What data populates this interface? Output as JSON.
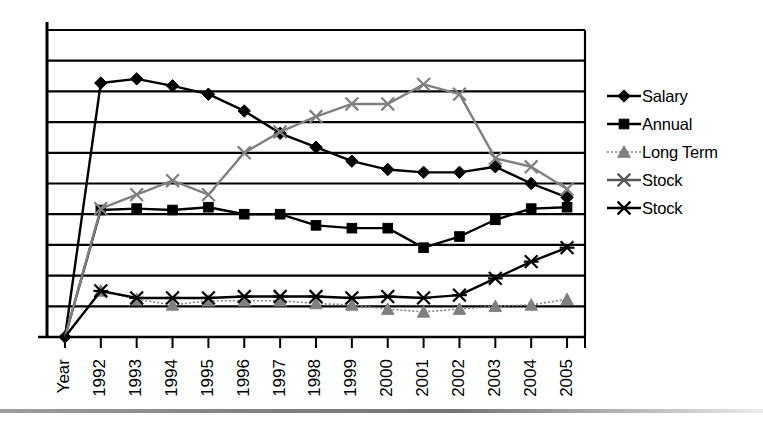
{
  "chart_data": {
    "type": "line",
    "title": "",
    "subtitle": "",
    "xlabel": "",
    "ylabel": "",
    "grid": true,
    "legend_position": "right",
    "x_tick_labels": [
      "Year",
      "1992",
      "1993",
      "1994",
      "1995",
      "1996",
      "1997",
      "1998",
      "1999",
      "2000",
      "2001",
      "2002",
      "2003",
      "2004",
      "2005"
    ],
    "x_axis_rotation_deg": -90,
    "y_axis_tick_labels": [],
    "ylim": [
      0,
      11
    ],
    "y_gridline_count": 11,
    "categories": [
      "Year",
      "1992",
      "1993",
      "1994",
      "1995",
      "1996",
      "1997",
      "1998",
      "1999",
      "2000",
      "2001",
      "2002",
      "2003",
      "2004",
      "2005"
    ],
    "series": [
      {
        "name": "Salary",
        "marker": "diamond",
        "color": "#000000",
        "line_style": "solid",
        "values": [
          0.0,
          9.1,
          9.25,
          9.0,
          8.7,
          8.1,
          7.3,
          6.8,
          6.3,
          6.0,
          5.9,
          5.9,
          6.1,
          5.5,
          5.0
        ]
      },
      {
        "name": "Annual",
        "marker": "square",
        "color": "#000000",
        "line_style": "solid",
        "values": [
          0.0,
          4.55,
          4.6,
          4.55,
          4.65,
          4.4,
          4.4,
          4.0,
          3.9,
          3.9,
          3.2,
          3.6,
          4.2,
          4.6,
          4.65
        ]
      },
      {
        "name": "Long Term",
        "marker": "triangle",
        "color": "#808080",
        "line_style": "dotted",
        "values": [
          0.0,
          1.65,
          1.35,
          1.15,
          1.3,
          1.3,
          1.3,
          1.2,
          1.15,
          1.0,
          0.9,
          1.0,
          1.1,
          1.15,
          1.35
        ]
      },
      {
        "name": "Stock",
        "marker": "x",
        "color": "#808080",
        "line_style": "solid",
        "values": [
          0.0,
          4.6,
          5.1,
          5.6,
          5.1,
          6.6,
          7.35,
          7.9,
          8.35,
          8.35,
          9.05,
          8.7,
          6.4,
          6.1,
          5.3
        ]
      },
      {
        "name": "Stock",
        "marker": "asterisk",
        "color": "#000000",
        "line_style": "solid",
        "values": [
          0.0,
          1.65,
          1.4,
          1.4,
          1.4,
          1.45,
          1.45,
          1.45,
          1.4,
          1.45,
          1.4,
          1.5,
          2.1,
          2.7,
          3.2
        ]
      }
    ]
  },
  "legend": {
    "items": [
      {
        "label": "Salary",
        "marker": "diamond",
        "color": "#000000",
        "name": "legend-marker-diamond-icon"
      },
      {
        "label": "Annual",
        "marker": "square",
        "color": "#000000",
        "name": "legend-marker-square-icon"
      },
      {
        "label": "Long Term",
        "marker": "triangle",
        "color": "#808080",
        "name": "legend-marker-triangle-icon"
      },
      {
        "label": "Stock",
        "marker": "x",
        "color": "#555555",
        "name": "legend-marker-x-icon"
      },
      {
        "label": "Stock",
        "marker": "asterisk",
        "color": "#000000",
        "name": "legend-marker-asterisk-icon"
      }
    ]
  },
  "colors": {
    "axis": "#000000",
    "grid": "#000000",
    "background": "#ffffff",
    "gray_series": "#808080",
    "black_series": "#000000"
  }
}
